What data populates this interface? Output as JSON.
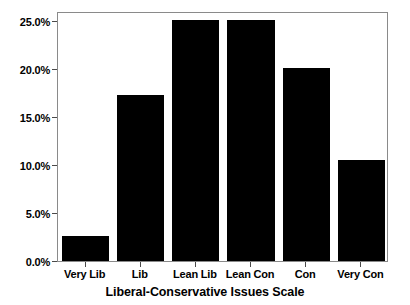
{
  "chart_data": {
    "type": "bar",
    "title": "",
    "subtitle": "",
    "xlabel": "Liberal-Conservative Issues Scale",
    "ylabel": "",
    "categories": [
      "Very Lib",
      "Lib",
      "Lean Lib",
      "Lean Con",
      "Con",
      "Very Con"
    ],
    "values": [
      2.6,
      17.3,
      25.1,
      25.1,
      20.1,
      10.5
    ],
    "value_labels": [
      "2.6%",
      "17.3%",
      "25.1%",
      "25.1%",
      "20.1%",
      "10.5%"
    ],
    "ylim": [
      0.0,
      26.0
    ],
    "ytick_values": [
      0.0,
      5.0,
      10.0,
      15.0,
      20.0,
      25.0
    ],
    "ytick_labels": [
      "0.0%",
      "5.0%",
      "10.0%",
      "15.0%",
      "20.0%",
      "25.0%"
    ],
    "xtick_labels": [
      "Very Lib",
      "Lib",
      "Lean Lib",
      "Lean Con",
      "Con",
      "Very Con"
    ],
    "grid": false,
    "legend": null,
    "legend_position": "none",
    "bar_color": "#000000",
    "axis_color": "#8a8a8a",
    "background_color": "#ffffff",
    "annotations": []
  },
  "axis": {
    "x_title": "Liberal-Conservative Issues Scale"
  }
}
